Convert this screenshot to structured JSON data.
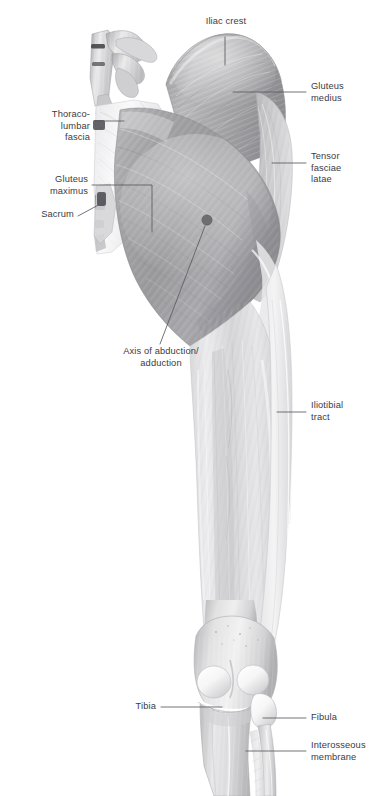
{
  "figure": {
    "view": "posterior",
    "background": "#ffffff",
    "label_color": "#3b3b42",
    "leader_color": "#5a5a62",
    "axis_marker": {
      "name": "axis-of-abduction-adduction-marker",
      "cx": 207,
      "cy": 220,
      "r": 5.2,
      "color": "#6d6d72"
    }
  },
  "labels": [
    {
      "id": "iliac-crest",
      "text": "Iliac crest",
      "side": "center",
      "x": 196,
      "y": 21,
      "width": 90,
      "align": "center"
    },
    {
      "id": "gluteus-medius",
      "text": "Gluteus\nmedius",
      "side": "right",
      "x": 311,
      "y": 86,
      "width": 76,
      "align": "left"
    },
    {
      "id": "tensor-fasciae-latae",
      "text": "Tensor\nfasciae\nlatae",
      "side": "right",
      "x": 311,
      "y": 155,
      "width": 76,
      "align": "left"
    },
    {
      "id": "thoracolumbar-fascia",
      "text": "Thoraco-\nlumbar\nfascia",
      "side": "left",
      "x": 18,
      "y": 113,
      "width": 74,
      "align": "right"
    },
    {
      "id": "gluteus-maximus",
      "text": "Gluteus\nmaximus",
      "side": "left",
      "x": 12,
      "y": 178,
      "width": 80,
      "align": "right"
    },
    {
      "id": "sacrum",
      "text": "Sacrum",
      "side": "left",
      "x": 22,
      "y": 211,
      "width": 70,
      "align": "right"
    },
    {
      "id": "axis-of-abduction-adduction",
      "text": "Axis of abduction/\nadduction",
      "side": "center",
      "x": 104,
      "y": 350,
      "width": 122,
      "align": "center"
    },
    {
      "id": "iliotibial-tract",
      "text": "Iliotibial\ntract",
      "side": "right",
      "x": 311,
      "y": 405,
      "width": 76,
      "align": "left"
    },
    {
      "id": "tibia",
      "text": "Tibia",
      "side": "left",
      "x": 120,
      "y": 700,
      "width": 44,
      "align": "right"
    },
    {
      "id": "fibula",
      "text": "Fibula",
      "side": "right",
      "x": 311,
      "y": 711,
      "width": 76,
      "align": "left"
    },
    {
      "id": "interosseous-membrane",
      "text": "Interosseous\nmembrane",
      "side": "right",
      "x": 311,
      "y": 744,
      "width": 78,
      "align": "left"
    }
  ],
  "structures": [
    {
      "id": "lumbar-vertebrae",
      "name": "Lumbar vertebrae"
    },
    {
      "id": "thoracolumbar-fascia",
      "name": "Thoracolumbar fascia"
    },
    {
      "id": "gluteus-medius",
      "name": "Gluteus medius"
    },
    {
      "id": "gluteus-maximus",
      "name": "Gluteus maximus"
    },
    {
      "id": "tensor-fasciae-latae",
      "name": "Tensor fasciae latae"
    },
    {
      "id": "iliotibial-tract",
      "name": "Iliotibial tract"
    },
    {
      "id": "femur-shaft",
      "name": "Femur / thigh"
    },
    {
      "id": "knee-joint",
      "name": "Knee joint"
    },
    {
      "id": "tibia",
      "name": "Tibia"
    },
    {
      "id": "fibula",
      "name": "Fibula"
    },
    {
      "id": "interosseous-membrane",
      "name": "Interosseous membrane"
    }
  ]
}
